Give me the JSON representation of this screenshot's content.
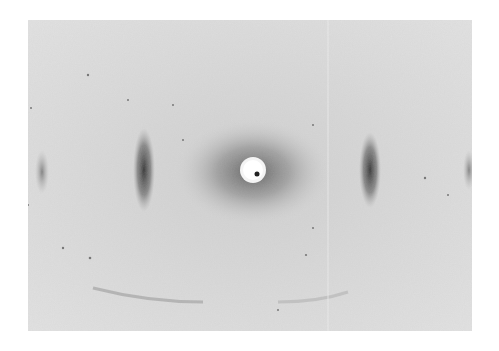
{
  "image": {
    "type": "x-ray-diffraction-pattern",
    "background_color": "#ffffff",
    "film_color": "#dcdcdc",
    "features": {
      "beam_stop": {
        "cx": 225,
        "cy": 150,
        "r": 12,
        "color": "#ffffff"
      },
      "beam_center_dot": {
        "cx": 229,
        "cy": 154,
        "r": 2.5,
        "color": "#222222"
      },
      "inner_reflections": [
        {
          "side": "left",
          "cx": 115,
          "cy": 150
        },
        {
          "side": "right",
          "cx": 342,
          "cy": 150
        }
      ],
      "outer_reflections": [
        {
          "side": "left",
          "cx": 14,
          "cy": 152
        },
        {
          "side": "right",
          "cx": 440,
          "cy": 150
        }
      ],
      "scratch_line_x": 300
    }
  }
}
